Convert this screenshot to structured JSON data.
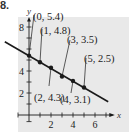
{
  "problem_number": "8.",
  "chart_data": {
    "type": "scatter",
    "title": "",
    "xlabel": "x",
    "ylabel": "y",
    "x_ticks": [
      2,
      4,
      6
    ],
    "y_ticks": [
      2,
      4,
      8
    ],
    "xlim": [
      -0.5,
      7
    ],
    "ylim": [
      -0.5,
      8.5
    ],
    "grid": false,
    "points": [
      {
        "x": 0,
        "y": 5.4,
        "label": "(0, 5.4)"
      },
      {
        "x": 1,
        "y": 4.8,
        "label": "(1, 4.8)"
      },
      {
        "x": 2,
        "y": 4.3,
        "label": "(2, 4.3)"
      },
      {
        "x": 3,
        "y": 3.5,
        "label": "(3, 3.5)"
      },
      {
        "x": 4,
        "y": 3.1,
        "label": "(4, 3.1)"
      },
      {
        "x": 5,
        "y": 2.5,
        "label": "(5, 2.5)"
      }
    ],
    "fit_line": {
      "type": "linear",
      "slope": -0.58,
      "intercept": 5.38
    }
  },
  "colors": {
    "panel_bg": "#e9e9e9",
    "ink": "#1a1a1a"
  }
}
